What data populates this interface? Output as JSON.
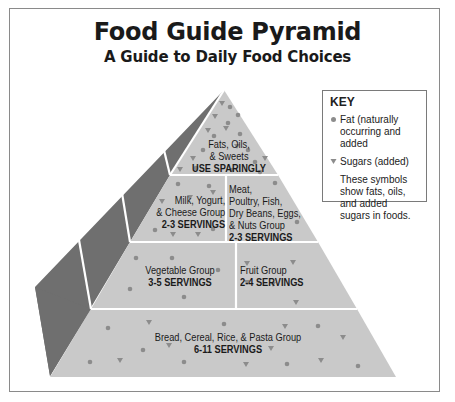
{
  "header": {
    "title": "Food Guide Pyramid",
    "subtitle": "A Guide to Daily Food Choices"
  },
  "key": {
    "title": "KEY",
    "items": [
      {
        "symbol": "circle-dot-icon",
        "label": "Fat (naturally occurring and added"
      },
      {
        "symbol": "triangle-down-icon",
        "label": "Sugars (added)"
      }
    ],
    "note": "These symbols show fats, oils, and added sugars in foods."
  },
  "pyramid": {
    "levels": [
      {
        "name": "Fats, Oils, & Sweets",
        "line1": "Fats, Oils,",
        "line2": "& Sweets",
        "servings": "USE SPARINGLY"
      },
      {
        "name": "Milk, Yogurt, & Cheese Group",
        "line1": "Milk, Yogurt,",
        "line2": "& Cheese Group",
        "servings": "2-3 SERVINGS"
      },
      {
        "name": "Meat, Poultry, Fish, Dry Beans, Eggs, & Nuts Group",
        "line1": "Meat,",
        "line2": "Poultry, Fish,",
        "line3": "Dry Beans, Eggs,",
        "line4": "& Nuts Group",
        "servings": "2-3 SERVINGS"
      },
      {
        "name": "Vegetable Group",
        "line1": "Vegetable Group",
        "servings": "3-5 SERVINGS"
      },
      {
        "name": "Fruit Group",
        "line1": "Fruit Group",
        "servings": "2-4 SERVINGS"
      },
      {
        "name": "Bread, Cereal, Rice, & Pasta Group",
        "line1": "Bread, Cereal, Rice, & Pasta Group",
        "servings": "6-11 SERVINGS"
      }
    ]
  },
  "colors": {
    "front_face": "#c9c9c9",
    "side_face": "#6f6f6f",
    "symbols": "#8c8c8c",
    "frame": "#8a8a8a",
    "divider": "#ffffff"
  }
}
